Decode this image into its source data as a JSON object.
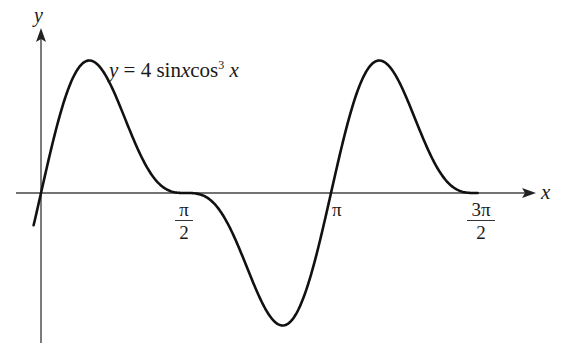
{
  "chart_data": {
    "type": "line",
    "equation_label": {
      "y": "y",
      "eq": "=",
      "coef": "4",
      "sin": "sin",
      "x1": "x",
      "cos": "cos",
      "exp": "3",
      "x2": "x"
    },
    "xlabel": "x",
    "ylabel": "y",
    "x_ticks": [
      {
        "value": 1.5708,
        "numerator": "π",
        "denominator": "2"
      },
      {
        "value": 3.1416,
        "label": "π"
      },
      {
        "value": 4.7124,
        "numerator": "3π",
        "denominator": "2"
      }
    ],
    "xlim": [
      -0.27,
      5.5
    ],
    "ylim": [
      -1.45,
      1.6
    ],
    "function": "4*sin(x)*cos(x)^3",
    "domain": [
      -0.08,
      4.73
    ],
    "series": [
      {
        "name": "y = 4 sin x cos³ x",
        "x": [
          0,
          0.5236,
          1.0472,
          1.5708,
          2.0944,
          2.618,
          3.1416,
          3.6652,
          4.1888,
          4.7124
        ],
        "values": [
          0,
          1.299,
          0.433,
          0,
          -0.433,
          -1.299,
          0,
          1.299,
          0.433,
          0
        ]
      }
    ],
    "extrema": {
      "max": [
        {
          "x": 0.5236,
          "y": 1.299
        },
        {
          "x": 3.6652,
          "y": 1.299
        }
      ],
      "min": [
        {
          "x": 2.618,
          "y": -1.299
        }
      ]
    },
    "grid": false,
    "legend": "none"
  }
}
